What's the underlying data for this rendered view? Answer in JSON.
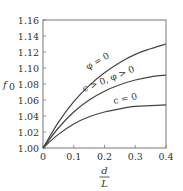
{
  "chart_data": {
    "type": "line",
    "title": "",
    "xlabel": "d/L",
    "xlabel_num": "d",
    "xlabel_den": "L",
    "ylabel": "f0",
    "xlim": [
      0,
      0.4
    ],
    "ylim": [
      1.0,
      1.16
    ],
    "grid": false,
    "legend": "inline annotations on curves",
    "x_ticks": [
      "0",
      "0.1",
      "0.2",
      "0.3",
      "0.4"
    ],
    "y_ticks": [
      "1.00",
      "1.02",
      "1.04",
      "1.06",
      "1.08",
      "1.10",
      "1.12",
      "1.14",
      "1.16"
    ],
    "x": [
      0,
      0.05,
      0.1,
      0.15,
      0.2,
      0.25,
      0.3,
      0.35,
      0.4
    ],
    "series": [
      {
        "name": "φ = 0",
        "values": [
          1.0,
          1.032,
          1.058,
          1.078,
          1.094,
          1.107,
          1.117,
          1.124,
          1.13
        ]
      },
      {
        "name": "c > 0, φ > 0",
        "values": [
          1.0,
          1.025,
          1.045,
          1.06,
          1.071,
          1.079,
          1.085,
          1.089,
          1.091
        ]
      },
      {
        "name": "c = 0",
        "values": [
          1.0,
          1.017,
          1.03,
          1.039,
          1.045,
          1.049,
          1.052,
          1.053,
          1.054
        ]
      }
    ]
  }
}
